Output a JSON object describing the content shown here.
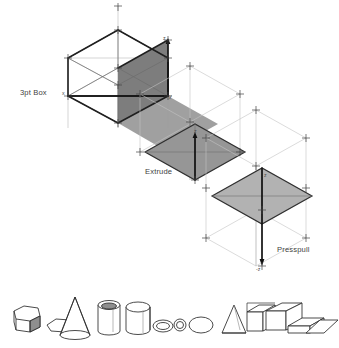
{
  "diagram": {
    "stages": [
      {
        "id": "stage-3pt-box",
        "label": "3pt Box",
        "label_x": 20,
        "label_y": 93,
        "fill": "#7d7d7d",
        "axis_marks": [
          {
            "name": "x",
            "text": "x",
            "x": 64,
            "y": 96
          },
          {
            "name": "z",
            "text": "z",
            "x": 165,
            "y": 44
          },
          {
            "name": "y",
            "text": "y",
            "x": 168,
            "y": 99
          }
        ]
      },
      {
        "id": "stage-extrude",
        "label": "Extrude",
        "label_x": 145,
        "label_y": 172,
        "fill": "#969696",
        "axis_marks": [
          {
            "name": "z",
            "text": "z",
            "x": 196,
            "y": 139
          }
        ]
      },
      {
        "id": "stage-presspull",
        "label": "Presspull",
        "label_x": 277,
        "label_y": 250,
        "fill": "#b2b2b2",
        "axis_marks": [
          {
            "name": "z",
            "text": "z",
            "x": 265,
            "y": 178
          },
          {
            "name": "minus-z",
            "text": "-z",
            "x": 256,
            "y": 268
          }
        ]
      }
    ],
    "colors": {
      "construction_line": "#9a9a9a",
      "construction_line_light": "#bdbdbd",
      "emphasis_line": "#1a1a1a",
      "face_dark": "#7d7d7d",
      "face_mid": "#969696",
      "face_light": "#b2b2b2",
      "outline": "#2b2b2b",
      "background": "#ffffff"
    }
  },
  "primitives": {
    "caption": "",
    "shapes": [
      {
        "name": "hexagonal-prism",
        "label": ""
      },
      {
        "name": "hexagon-flat",
        "label": ""
      },
      {
        "name": "cone",
        "label": ""
      },
      {
        "name": "cylinder-tube",
        "label": ""
      },
      {
        "name": "cylinder-solid",
        "label": ""
      },
      {
        "name": "ellipse-ring",
        "label": ""
      },
      {
        "name": "ellipse-ring-small",
        "label": ""
      },
      {
        "name": "ellipse-flat",
        "label": ""
      },
      {
        "name": "pyramid",
        "label": ""
      },
      {
        "name": "box-tall",
        "label": ""
      },
      {
        "name": "box-wide",
        "label": ""
      },
      {
        "name": "box-flat",
        "label": ""
      },
      {
        "name": "plane-flat",
        "label": ""
      }
    ]
  }
}
